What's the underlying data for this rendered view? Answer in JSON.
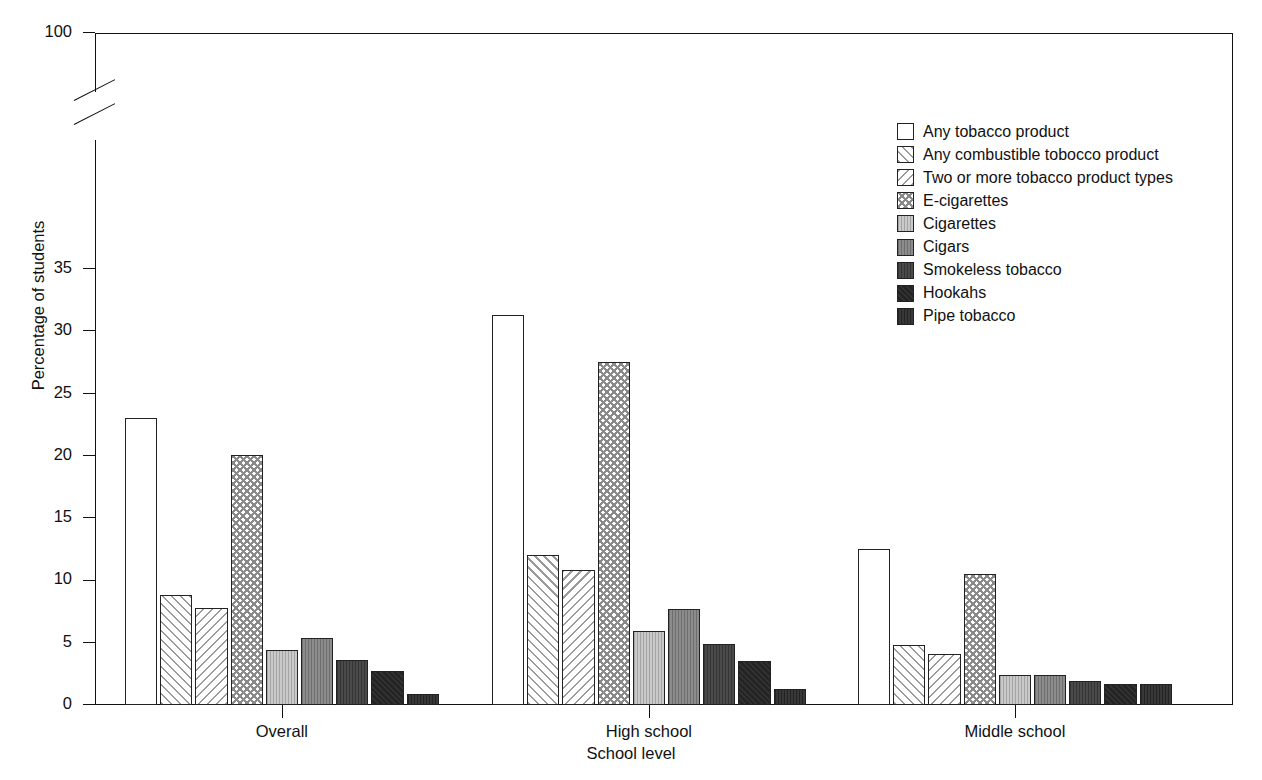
{
  "chart_data": {
    "type": "bar",
    "title": "",
    "xlabel": "School level",
    "ylabel": "Percentage of students",
    "categories": [
      "Overall",
      "High school",
      "Middle school"
    ],
    "ylim": [
      0,
      35
    ],
    "y_axis_break": true,
    "y_break_note": "Axis broken between 35 and 100",
    "yticks": [
      0,
      5,
      10,
      15,
      20,
      25,
      30,
      35,
      100
    ],
    "ytick_labels": [
      "0",
      "5",
      "10",
      "15",
      "20",
      "25",
      "30",
      "35",
      "100"
    ],
    "grid": false,
    "legend_position": "upper right",
    "series": [
      {
        "name": "Any tobacco product",
        "pattern": "none",
        "values": [
          23.0,
          31.3,
          12.5
        ]
      },
      {
        "name": "Any combustible tobocco product",
        "pattern": "fdiag",
        "values": [
          8.8,
          12.0,
          4.8
        ]
      },
      {
        "name": "Two or more tobacco product types",
        "pattern": "bdiag",
        "values": [
          7.8,
          10.8,
          4.1
        ]
      },
      {
        "name": "E-cigarettes",
        "pattern": "cross",
        "values": [
          20.1,
          27.5,
          10.5
        ]
      },
      {
        "name": "Cigarettes",
        "pattern": "ltgray",
        "values": [
          4.4,
          5.9,
          2.4
        ]
      },
      {
        "name": "Cigars",
        "pattern": "mgray",
        "values": [
          5.4,
          7.7,
          2.4
        ]
      },
      {
        "name": "Smokeless tobacco",
        "pattern": "dgray",
        "values": [
          3.6,
          4.9,
          1.9
        ]
      },
      {
        "name": "Hookahs",
        "pattern": "vdark",
        "values": [
          2.7,
          3.5,
          1.7
        ]
      },
      {
        "name": "Pipe tobacco",
        "pattern": "pipe",
        "values": [
          0.9,
          1.3,
          1.65
        ]
      }
    ]
  }
}
